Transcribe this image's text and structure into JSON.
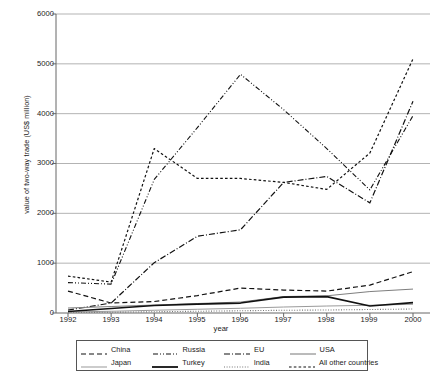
{
  "chart_data": {
    "type": "line",
    "title": "",
    "xlabel": "year",
    "ylabel": "value of two-way trade (US$ million)",
    "categories": [
      "1992",
      "1993",
      "1994",
      "1995",
      "1996",
      "1997",
      "1998",
      "1999",
      "2000"
    ],
    "x": [
      1992,
      1993,
      1994,
      1995,
      1996,
      1997,
      1998,
      1999,
      2000
    ],
    "ylim": [
      0,
      6000
    ],
    "yticks": [
      "0",
      "1000",
      "2000",
      "3000",
      "4000",
      "5000",
      "6000"
    ],
    "ytick_values": [
      0,
      1000,
      2000,
      3000,
      4000,
      5000,
      6000
    ],
    "grid": "horizontal",
    "legend_position": "bottom",
    "series": [
      {
        "name": "China",
        "dash": "dashed",
        "values": [
          440,
          200,
          230,
          350,
          500,
          460,
          440,
          560,
          830
        ]
      },
      {
        "name": "Russia",
        "dash": "dash-dot-dot",
        "values": [
          0,
          0,
          0,
          0,
          0,
          0,
          0,
          0,
          0
        ]
      },
      {
        "name": "EU",
        "dash": "dash-dot",
        "values": [
          60,
          200,
          1010,
          1540,
          1670,
          2620,
          2740,
          2210,
          4250
        ]
      },
      {
        "name": "USA",
        "dash": "solid-thin",
        "values": [
          100,
          130,
          160,
          190,
          220,
          330,
          345,
          430,
          480
        ]
      },
      {
        "name": "Japan",
        "dash": "solid-thin",
        "values": [
          20,
          35,
          55,
          75,
          95,
          120,
          140,
          155,
          175
        ]
      },
      {
        "name": "Turkey",
        "dash": "solid-thick",
        "values": [
          30,
          90,
          150,
          180,
          200,
          320,
          330,
          140,
          210
        ]
      },
      {
        "name": "India",
        "dash": "dotted",
        "values": [
          10,
          15,
          25,
          35,
          45,
          55,
          60,
          70,
          80
        ]
      },
      {
        "name": "All other countries",
        "dash": "short-dash",
        "values": [
          740,
          620,
          3300,
          2700,
          2700,
          2620,
          2480,
          3210,
          5100
        ]
      }
    ],
    "series_russia_values": [
      610,
      580,
      2680,
      3720,
      4790,
      4080,
      3300,
      2470,
      3960
    ],
    "legend_entries": [
      {
        "label": "China",
        "icon": "dashed-line-swatch"
      },
      {
        "label": "Russia",
        "icon": "dash-dot-dot-line-swatch"
      },
      {
        "label": "EU",
        "icon": "dash-dot-line-swatch"
      },
      {
        "label": "USA",
        "icon": "thin-solid-line-swatch"
      },
      {
        "label": "Japan",
        "icon": "thin-solid-line-swatch"
      },
      {
        "label": "Turkey",
        "icon": "thick-solid-line-swatch"
      },
      {
        "label": "India",
        "icon": "dotted-line-swatch"
      },
      {
        "label": "All other countries",
        "icon": "short-dash-line-swatch"
      }
    ],
    "colors": {
      "axis": "#555555",
      "grid": "#aaaaaa",
      "line": "#111111",
      "background": "#ffffff"
    }
  }
}
